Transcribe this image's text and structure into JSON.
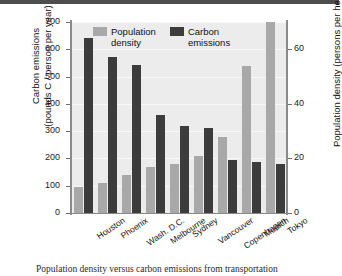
{
  "chart_data": {
    "type": "bar",
    "title": "",
    "categories": [
      "Houston",
      "Phoenix",
      "Wash. D.C.",
      "Melbourne",
      "Sydney",
      "Vancouver",
      "Copenhagen",
      "Munich",
      "Tokyo"
    ],
    "series": [
      {
        "name": "Population density",
        "axis": "right",
        "unit": "persons per hectare",
        "color": "#a8a8a8",
        "values": [
          9.5,
          11,
          14,
          17,
          18,
          21,
          28,
          54,
          70
        ]
      },
      {
        "name": "Carbon emissions",
        "axis": "left",
        "unit": "pounds C / person per year",
        "color": "#3c3c3c",
        "values": [
          640,
          573,
          543,
          360,
          320,
          313,
          195,
          187,
          178
        ]
      }
    ],
    "left_axis": {
      "label_line1": "Carbon emissions",
      "label_line2": "(pounds C / person per year)",
      "ticks": [
        0,
        100,
        200,
        300,
        400,
        500,
        600,
        700
      ],
      "ylim": [
        0,
        700
      ]
    },
    "right_axis": {
      "label": "Population density (persons per hectare)",
      "ticks": [
        0,
        20,
        40,
        60
      ],
      "ylim": [
        0,
        70
      ]
    },
    "legend": {
      "position": "top-left-inside",
      "entries": [
        {
          "label_line1": "Population",
          "label_line2": "density",
          "color": "#a8a8a8"
        },
        {
          "label_line1": "Carbon",
          "label_line2": "emissions",
          "color": "#3c3c3c"
        }
      ]
    },
    "grid": true,
    "plot_background": "#ececec"
  },
  "caption": {
    "text": "Population density versus carbon emissions from transportation"
  }
}
